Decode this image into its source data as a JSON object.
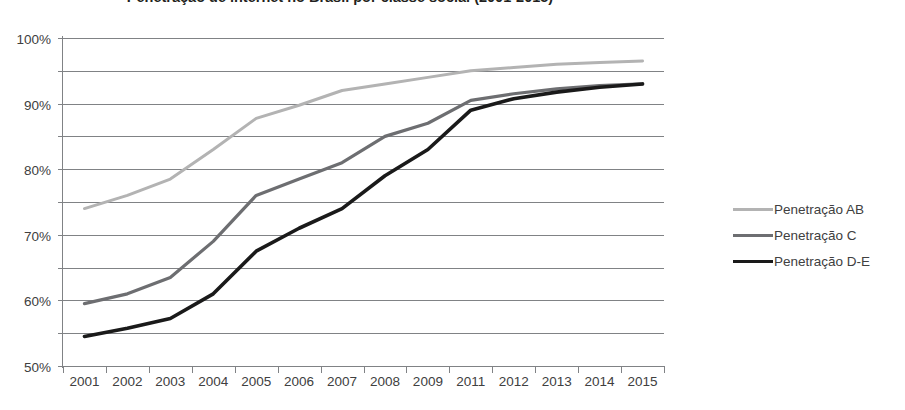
{
  "chart_data": {
    "type": "line",
    "title": "Penetração de internet no Brasil por classe social (2001-2015)",
    "xlabel": "",
    "ylabel": "",
    "ylim": [
      0,
      100
    ],
    "ytick_labels": [
      "0%",
      "10%",
      "20%",
      "30%",
      "40%",
      "50%",
      "60%",
      "70%",
      "80%",
      "90%",
      "100%"
    ],
    "ytick_values": [
      0,
      10,
      20,
      30,
      40,
      50,
      60,
      70,
      80,
      90,
      100
    ],
    "grid": true,
    "legend_position": "right",
    "categories": [
      "2001",
      "2002",
      "2003",
      "2004",
      "2005",
      "2006",
      "2007",
      "2008",
      "2009",
      "2011",
      "2012",
      "2013",
      "2014",
      "2015"
    ],
    "series": [
      {
        "name": "Penetração AB",
        "color": "#b3b3b3",
        "values": [
          48,
          52,
          57,
          66,
          75.5,
          79.5,
          84,
          86,
          88,
          90,
          91,
          92,
          92.5,
          93
        ]
      },
      {
        "name": "Penetração C",
        "color": "#6d6e71",
        "values": [
          19,
          22,
          27,
          38,
          52,
          57,
          62,
          70,
          74,
          81,
          83,
          84.5,
          85.5,
          86
        ]
      },
      {
        "name": "Penetração D-E",
        "color": "#1a1a1a",
        "values": [
          9,
          11.5,
          14.5,
          22,
          35,
          42,
          48,
          58,
          66,
          78,
          81.5,
          83.5,
          85,
          86
        ]
      }
    ]
  },
  "axis": {
    "line_color": "#808285",
    "grid_color": "#808285"
  }
}
